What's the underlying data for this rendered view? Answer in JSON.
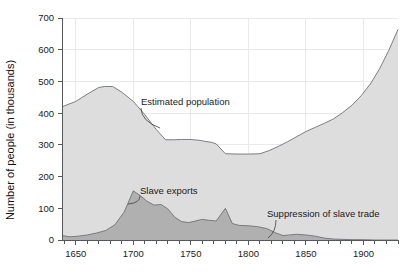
{
  "chart_data": {
    "type": "area",
    "title": "",
    "xlabel": "",
    "ylabel": "Number of people (in thousands)",
    "xlim": [
      1638,
      1930
    ],
    "ylim": [
      0,
      700
    ],
    "grid": true,
    "legend_position": "none",
    "y_ticks": [
      0,
      100,
      200,
      300,
      400,
      500,
      600,
      700
    ],
    "y_tick_labels": [
      "0",
      "100",
      "200",
      "300",
      "400",
      "500",
      "600",
      "700"
    ],
    "x_ticks": [
      1650,
      1700,
      1750,
      1800,
      1850,
      1900
    ],
    "x_tick_labels": [
      "1650",
      "1700",
      "1750",
      "1800",
      "1850",
      "1900"
    ],
    "x_minor_tick_step": 10,
    "series": [
      {
        "name": "Estimated population",
        "fill_color": "#dddddd",
        "line_color": "#7d8185",
        "x": [
          1638,
          1650,
          1660,
          1670,
          1675,
          1682,
          1690,
          1700,
          1710,
          1720,
          1728,
          1735,
          1742,
          1750,
          1758,
          1764,
          1768,
          1772,
          1780,
          1790,
          1800,
          1810,
          1818,
          1826,
          1834,
          1842,
          1850,
          1858,
          1866,
          1874,
          1882,
          1890,
          1898,
          1906,
          1914,
          1922,
          1930
        ],
        "values": [
          420,
          437,
          460,
          481,
          484,
          484,
          466,
          437,
          395,
          348,
          316,
          316,
          317,
          317,
          314,
          310,
          308,
          303,
          272,
          271,
          271,
          272,
          282,
          295,
          310,
          326,
          342,
          355,
          368,
          382,
          402,
          425,
          455,
          492,
          540,
          598,
          664
        ]
      },
      {
        "name": "Slave exports",
        "fill_color": "#b0b0b0",
        "line_color": "#6e7276",
        "x": [
          1638,
          1645,
          1652,
          1660,
          1668,
          1676,
          1684,
          1692,
          1700,
          1706,
          1712,
          1718,
          1724,
          1730,
          1736,
          1742,
          1748,
          1754,
          1760,
          1766,
          1772,
          1780,
          1786,
          1792,
          1800,
          1808,
          1816,
          1824,
          1830,
          1836,
          1842,
          1850,
          1858,
          1866,
          1874,
          1882,
          1890,
          1900,
          1910,
          1920,
          1930
        ],
        "values": [
          14,
          10,
          12,
          16,
          22,
          30,
          48,
          88,
          155,
          140,
          122,
          110,
          112,
          98,
          72,
          58,
          55,
          60,
          65,
          62,
          60,
          100,
          52,
          46,
          45,
          42,
          36,
          22,
          14,
          16,
          18,
          16,
          12,
          6,
          3,
          2,
          1,
          1,
          0,
          0,
          0
        ]
      }
    ],
    "annotations": [
      {
        "text": "Estimated population",
        "x_px": 141,
        "y_px": 105,
        "leader_from": [
          141,
          108
        ],
        "leader_to": [
          160,
          128
        ]
      },
      {
        "text": "Slave exports",
        "x_px": 140,
        "y_px": 194,
        "leader_from": [
          140,
          196
        ],
        "leader_to": [
          128,
          204
        ]
      },
      {
        "text": "Suppression of slave trade",
        "x_px": 267,
        "y_px": 217,
        "leader_from": [
          276,
          220
        ],
        "leader_to": [
          268,
          238
        ]
      }
    ]
  }
}
